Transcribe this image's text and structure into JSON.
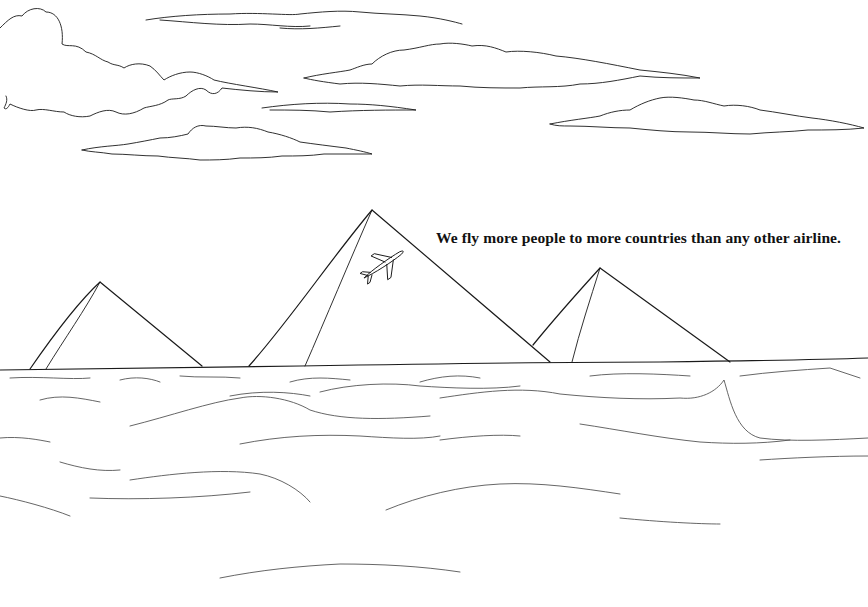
{
  "ad": {
    "tagline": "We fly more people to more countries than any other airline."
  },
  "scene": {
    "style": "line-art coloring page",
    "elements": [
      "clouds",
      "pyramids",
      "airplane-silhouette",
      "sand-dunes"
    ],
    "colors": {
      "background": "#ffffff",
      "line": "#1a1a1a"
    }
  }
}
